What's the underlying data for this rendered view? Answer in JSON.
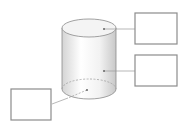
{
  "diagram": {
    "label_boxes": [
      {
        "id": "top-face-label",
        "text": "",
        "points_to": "top face"
      },
      {
        "id": "lateral-surface-label",
        "text": "",
        "points_to": "lateral surface"
      },
      {
        "id": "base-label",
        "text": "",
        "points_to": "bottom base"
      }
    ],
    "colors": {
      "outline": "#8a8a8a",
      "box_border": "#8c8c8c",
      "top_face": "#f4f4f4",
      "body_light": "#ffffff",
      "body_dark": "#cfcfcf",
      "leader": "#9a9a9a"
    }
  }
}
